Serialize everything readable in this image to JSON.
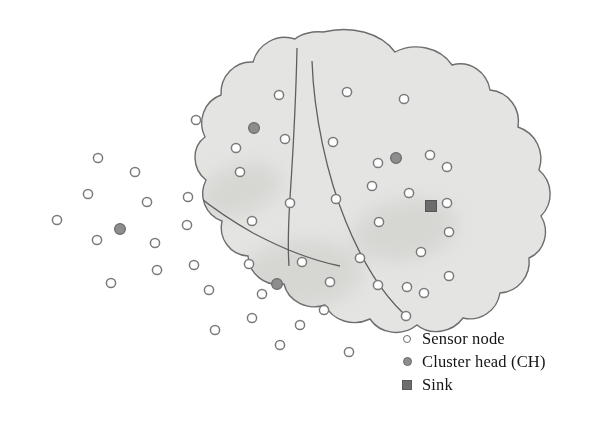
{
  "figure": {
    "kind": "wireless-sensor-network-cluster-diagram",
    "canvas": {
      "width": 611,
      "height": 430,
      "background": "#ffffff"
    }
  },
  "colors": {
    "field_fill": "#e4e4e2",
    "field_fill_lower": "#ffffff",
    "field_outline": "#6d6d6d",
    "cluster_divider": "#5f5f5f",
    "shadow_blob": "#d6d6d3",
    "sensor_fill": "#ffffff",
    "sensor_stroke": "#7a7a7a",
    "cluster_head_fill": "#8d8d8d",
    "cluster_head_stroke": "#6a6a6a",
    "sink_fill": "#6d6d6d",
    "sink_stroke": "#555555",
    "legend_text": "#141414"
  },
  "legend": {
    "items": [
      {
        "marker": "sensor-node-marker",
        "label": "Sensor node"
      },
      {
        "marker": "cluster-head-marker",
        "label": "Cluster head (CH)"
      },
      {
        "marker": "sink-marker",
        "label": "Sink"
      }
    ]
  },
  "field": {
    "outline_path": "M 323 32 C 352 25 381 33 395 52 C 414 42 440 47 452 65 C 470 60 487 72 490 90 C 509 92 521 109 518 127 C 536 133 545 152 539 170 C 553 182 554 203 541 216 C 550 231 545 251 529 258 C 531 276 518 292 500 293 C 497 311 480 322 463 318 C 452 333 430 336 417 325 C 402 337 380 334 370 319 C 353 327 333 321 325 305 C 307 311 288 301 284 284 C 265 287 249 274 248 256 C 230 255 218 238 222 221 C 205 215 198 196 206 180 C 192 169 191 147 205 137 C 197 121 204 101 221 95 C 220 76 235 61 253 62 C 258 44 277 33 295 39 C 301 34 312 31 323 32 Z",
    "clusters": [
      {
        "id": "cluster-top-left",
        "name": "cluster-region-1",
        "divider_path": "M 127 121 C 150 157 196 201 253 233 C 285 250 315 261 340 266"
      },
      {
        "id": "cluster-top-middle",
        "name": "cluster-region-2",
        "divider_path": "M 297 48 C 296 96 293 153 290 198 C 288 230 288 252 289 266"
      },
      {
        "id": "cluster-right",
        "name": "cluster-region-3",
        "divider_path": "M 312 61 C 314 116 327 176 346 222 C 364 266 385 296 404 314"
      },
      {
        "id": "cluster-bottom-left",
        "name": "cluster-region-4",
        "divider_path": "M 225 266 C 222 290 217 312 209 330 C 201 347 193 358 186 365"
      }
    ],
    "shadow_blobs": [
      {
        "cx": 118,
        "cy": 250,
        "rx": 78,
        "ry": 48,
        "rot": -12
      },
      {
        "cx": 300,
        "cy": 275,
        "rx": 62,
        "ry": 34,
        "rot": -6
      },
      {
        "cx": 405,
        "cy": 230,
        "rx": 52,
        "ry": 30,
        "rot": -10
      },
      {
        "cx": 240,
        "cy": 190,
        "rx": 42,
        "ry": 24,
        "rot": -18
      }
    ]
  },
  "nodes": {
    "sensor_radius": 4.6,
    "sensor_positions": [
      [
        279,
        95
      ],
      [
        347,
        92
      ],
      [
        404,
        99
      ],
      [
        196,
        120
      ],
      [
        285,
        139
      ],
      [
        236,
        148
      ],
      [
        333,
        142
      ],
      [
        378,
        163
      ],
      [
        430,
        155
      ],
      [
        98,
        158
      ],
      [
        135,
        172
      ],
      [
        240,
        172
      ],
      [
        88,
        194
      ],
      [
        147,
        202
      ],
      [
        188,
        197
      ],
      [
        372,
        186
      ],
      [
        447,
        167
      ],
      [
        290,
        203
      ],
      [
        336,
        199
      ],
      [
        57,
        220
      ],
      [
        187,
        225
      ],
      [
        409,
        193
      ],
      [
        97,
        240
      ],
      [
        379,
        222
      ],
      [
        447,
        203
      ],
      [
        252,
        221
      ],
      [
        155,
        243
      ],
      [
        194,
        265
      ],
      [
        249,
        264
      ],
      [
        302,
        262
      ],
      [
        360,
        258
      ],
      [
        421,
        252
      ],
      [
        449,
        232
      ],
      [
        157,
        270
      ],
      [
        262,
        294
      ],
      [
        330,
        282
      ],
      [
        378,
        285
      ],
      [
        407,
        287
      ],
      [
        209,
        290
      ],
      [
        111,
        283
      ],
      [
        324,
        310
      ],
      [
        252,
        318
      ],
      [
        300,
        325
      ],
      [
        406,
        316
      ],
      [
        424,
        293
      ],
      [
        215,
        330
      ],
      [
        280,
        345
      ],
      [
        349,
        352
      ],
      [
        449,
        276
      ]
    ],
    "cluster_heads": {
      "radius": 5.4,
      "positions": [
        {
          "x": 254,
          "y": 128,
          "cluster": "cluster-top-middle"
        },
        {
          "x": 396,
          "y": 158,
          "cluster": "cluster-right"
        },
        {
          "x": 120,
          "y": 229,
          "cluster": "cluster-top-left"
        },
        {
          "x": 277,
          "y": 284,
          "cluster": "cluster-bottom-left"
        }
      ]
    },
    "sink": {
      "x": 431,
      "y": 206,
      "size": 11
    }
  }
}
